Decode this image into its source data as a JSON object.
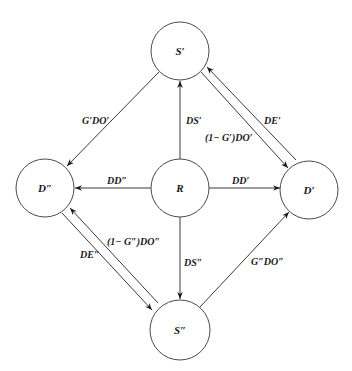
{
  "diagram": {
    "nodes": [
      {
        "id": "S1",
        "label": "S′",
        "cx": 180,
        "cy": 51,
        "r": 29
      },
      {
        "id": "D2",
        "label": "D″",
        "cx": 45,
        "cy": 188,
        "r": 29
      },
      {
        "id": "R",
        "label": "R",
        "cx": 180,
        "cy": 188,
        "r": 29
      },
      {
        "id": "D1",
        "label": "D′",
        "cx": 309,
        "cy": 190,
        "r": 29
      },
      {
        "id": "S2",
        "label": "S″",
        "cx": 180,
        "cy": 330,
        "r": 30
      }
    ],
    "edges": [
      {
        "id": "e1",
        "from": "S1",
        "to": "D2",
        "label": "G′DO′",
        "x1": 159,
        "y1": 72,
        "x2": 67,
        "y2": 166,
        "lx": 82,
        "ly": 124
      },
      {
        "id": "e2",
        "from": "R",
        "to": "S1",
        "label": "DS′",
        "x1": 180,
        "y1": 159,
        "x2": 180,
        "y2": 81,
        "lx": 186,
        "ly": 124
      },
      {
        "id": "e3",
        "from": "R",
        "to": "D2",
        "label": "DD″",
        "x1": 151,
        "y1": 188,
        "x2": 75,
        "y2": 188,
        "lx": 107,
        "ly": 184
      },
      {
        "id": "e4",
        "from": "R",
        "to": "D1",
        "label": "DD′",
        "x1": 209,
        "y1": 188,
        "x2": 280,
        "y2": 188,
        "lx": 232,
        "ly": 184
      },
      {
        "id": "e5",
        "from": "R",
        "to": "S2",
        "label": "DS″",
        "x1": 180,
        "y1": 217,
        "x2": 180,
        "y2": 299,
        "lx": 184,
        "ly": 266
      },
      {
        "id": "e6",
        "from": "S1",
        "to": "D1",
        "label": "(1− G′)DO′",
        "x1": 201,
        "y1": 72,
        "x2": 288,
        "y2": 168,
        "lx": 205,
        "ly": 141
      },
      {
        "id": "e7",
        "from": "D1",
        "to": "S1",
        "label": "DE′",
        "x1": 296,
        "y1": 160,
        "x2": 207,
        "y2": 67,
        "lx": 264,
        "ly": 124
      },
      {
        "id": "e8",
        "from": "D2",
        "to": "S2",
        "label": "DE″",
        "x1": 62,
        "y1": 213,
        "x2": 152,
        "y2": 310,
        "lx": 80,
        "ly": 258
      },
      {
        "id": "e9",
        "from": "S2",
        "to": "D2",
        "label": "(1− G″)DO″",
        "x1": 158,
        "y1": 303,
        "x2": 70,
        "y2": 208,
        "lx": 107,
        "ly": 245
      },
      {
        "id": "e10",
        "from": "S2",
        "to": "D1",
        "label": "G″DO″",
        "x1": 200,
        "y1": 307,
        "x2": 289,
        "y2": 212,
        "lx": 251,
        "ly": 265
      }
    ]
  }
}
